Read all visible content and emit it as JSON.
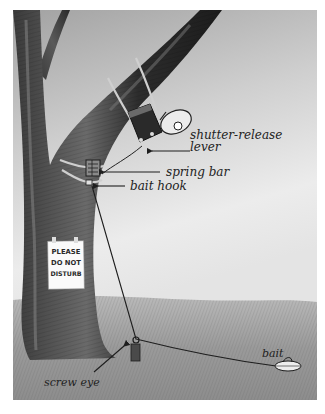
{
  "figure": {
    "colors": {
      "background": "#ffffff",
      "sky_top": "#a9a9a9",
      "sky_bottom": "#e6e6e6",
      "grass": "#9c9c9c",
      "bark_dark": "#2e2e2e",
      "bark_mid": "#555555",
      "line": "#1e1e1e"
    }
  },
  "labels": {
    "shutter_release_line1": "shutter-release",
    "shutter_release_line2": "lever",
    "spring_bar": "spring bar",
    "bait_hook": "bait hook",
    "screw_eye": "screw eye",
    "bait": "bait"
  },
  "sign": {
    "line1": "PLEASE",
    "line2": "DO NOT",
    "line3": "DISTURB"
  },
  "icons": {
    "camera": "camera-flash-icon",
    "arrow": "arrow-left-icon"
  }
}
